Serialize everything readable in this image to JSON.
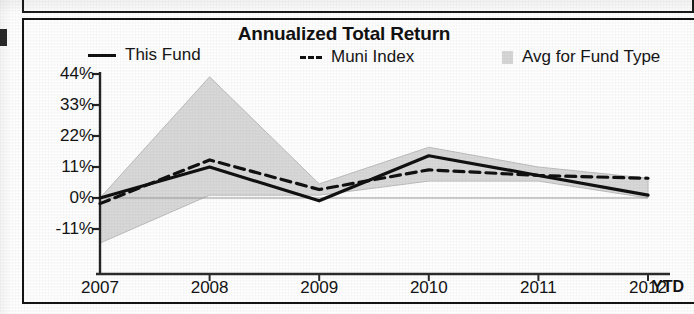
{
  "chart_panel": {
    "title": "Annualized Total Return",
    "ytd_suffix": "YTD"
  },
  "legend": {
    "items": [
      {
        "label": "This Fund",
        "marker": "solid-line-swatch",
        "color": "#111111"
      },
      {
        "label": "Muni Index",
        "marker": "dashed-line-swatch",
        "color": "#111111"
      },
      {
        "label": "Avg for Fund Type",
        "marker": "shaded-band-swatch",
        "color": "#d2d2d2"
      }
    ]
  },
  "axes": {
    "y_ticks": [
      "44%",
      "33%",
      "22%",
      "11%",
      "0%",
      "-11%"
    ],
    "x_ticks": [
      "2007",
      "2008",
      "2009",
      "2010",
      "2011",
      "2012"
    ]
  },
  "chart_data": {
    "type": "line",
    "title": "Annualized Total Return",
    "xlabel": "",
    "ylabel": "",
    "x": [
      "2007",
      "2008",
      "2009",
      "2010",
      "2011",
      "2012"
    ],
    "categories": [
      "2007",
      "2008",
      "2009",
      "2010",
      "2011",
      "2012"
    ],
    "ylim": [
      -22,
      44
    ],
    "ytick_values": [
      44,
      33,
      22,
      11,
      0,
      -11
    ],
    "ytick_labels": [
      "44%",
      "33%",
      "22%",
      "11%",
      "0%",
      "-11%"
    ],
    "grid": false,
    "zero_line": true,
    "legend_position": "top",
    "series": [
      {
        "name": "This Fund",
        "style": "solid",
        "color": "#111111",
        "values": [
          0,
          11,
          -1,
          15,
          8,
          1
        ]
      },
      {
        "name": "Muni Index",
        "style": "dashed",
        "color": "#111111",
        "values": [
          -2,
          13.5,
          3,
          10,
          8,
          7
        ]
      },
      {
        "name": "Avg for Fund Type",
        "style": "band",
        "color": "#d2d2d2",
        "upper": [
          0,
          43,
          5,
          18,
          11,
          7
        ],
        "lower": [
          -16,
          1,
          1,
          6,
          6,
          0
        ]
      }
    ]
  }
}
